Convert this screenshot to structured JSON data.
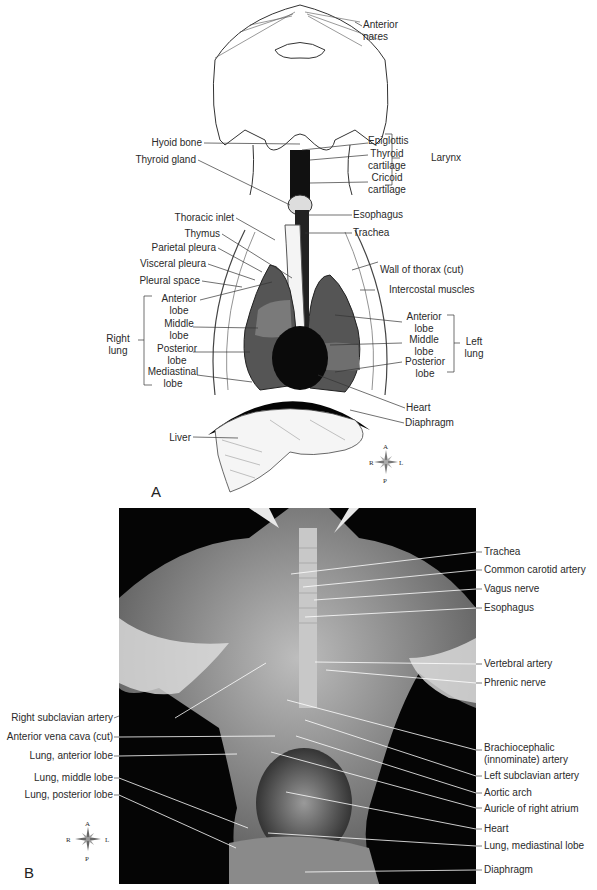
{
  "figure": {
    "panel_a": {
      "letter": "A",
      "labels_right": {
        "anterior_nares": [
          "Anterior",
          "nares"
        ],
        "epiglottis": "Epiglottis",
        "thyroid_cartilage": [
          "Thyroid",
          "cartilage"
        ],
        "cricoid_cartilage": [
          "Cricoid",
          "cartilage"
        ],
        "larynx": "Larynx",
        "esophagus": "Esophagus",
        "trachea": "Trachea",
        "wall_of_thorax": "Wall of thorax (cut)",
        "intercostal_muscles": "Intercostal muscles",
        "left_anterior_lobe": [
          "Anterior",
          "lobe"
        ],
        "left_middle_lobe": [
          "Middle",
          "lobe"
        ],
        "left_posterior_lobe": [
          "Posterior",
          "lobe"
        ],
        "left_lung": [
          "Left",
          "lung"
        ],
        "heart": "Heart",
        "diaphragm": "Diaphragm"
      },
      "labels_left": {
        "hyoid_bone": "Hyoid bone",
        "thyroid_gland": "Thyroid gland",
        "thoracic_inlet": "Thoracic inlet",
        "thymus": "Thymus",
        "parietal_pleura": "Parietal pleura",
        "visceral_pleura": "Visceral pleura",
        "pleural_space": "Pleural space",
        "right_anterior_lobe": [
          "Anterior",
          "lobe"
        ],
        "right_middle_lobe": [
          "Middle",
          "lobe"
        ],
        "right_posterior_lobe": [
          "Posterior",
          "lobe"
        ],
        "right_mediastinal_lobe": [
          "Mediastinal",
          "lobe"
        ],
        "right_lung": [
          "Right",
          "lung"
        ],
        "liver": "Liver"
      },
      "compass": {
        "a": "A",
        "p": "P",
        "r": "R",
        "l": "L"
      }
    },
    "panel_b": {
      "letter": "B",
      "labels_right": [
        "Trachea",
        "Common carotid artery",
        "Vagus nerve",
        "Esophagus",
        "Vertebral artery",
        "Phrenic nerve",
        "Brachiocephalic",
        "(innominate) artery",
        "Left subclavian artery",
        "Aortic arch",
        "Auricle of right atrium",
        "Heart",
        "Lung, mediastinal lobe",
        "Diaphragm"
      ],
      "labels_left": [
        "Right subclavian artery",
        "Anterior vena cava (cut)",
        "Lung, anterior lobe",
        "Lung, middle lobe",
        "Lung, posterior lobe"
      ],
      "compass": {
        "a": "A",
        "p": "P",
        "r": "R",
        "l": "L"
      }
    }
  }
}
